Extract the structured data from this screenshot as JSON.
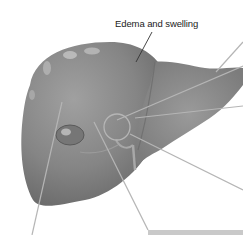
{
  "figure": {
    "labels": [
      {
        "id": "edema",
        "text": "Edema and swelling"
      }
    ],
    "colors": {
      "organ_fill": "#8a8a8a",
      "organ_dark": "#6e6e6e",
      "highlight": "#c4c4c4",
      "leader_line": "#b5b5b5",
      "label_line": "#333333",
      "caption_bar": "#c9c9c9"
    }
  }
}
